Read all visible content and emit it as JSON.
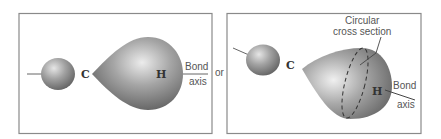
{
  "figure": {
    "separator": "or",
    "panels": [
      {
        "id": "side-view",
        "labels": {
          "carbon": "C",
          "hydrogen": "H",
          "axis_line1": "Bond",
          "axis_line2": "axis"
        }
      },
      {
        "id": "perspective-view",
        "labels": {
          "carbon": "C",
          "hydrogen": "H",
          "axis_line1": "Bond",
          "axis_line2": "axis",
          "cross_section_line1": "Circular",
          "cross_section_line2": "cross section"
        }
      }
    ]
  },
  "colors": {
    "frame": "#8a8a8a",
    "lobe_dark": "#6a6a6a",
    "lobe_mid": "#9a9a9a",
    "lobe_light": "#e8e8e8",
    "text": "#555555"
  }
}
